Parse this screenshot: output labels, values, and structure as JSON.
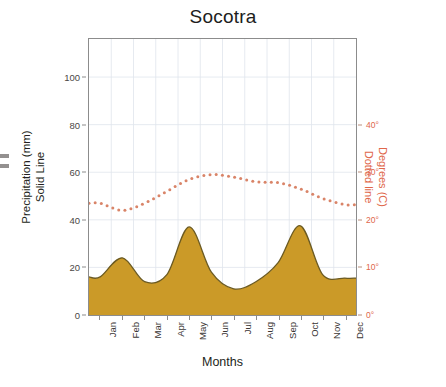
{
  "chart_data": {
    "type": "area",
    "title": "Socotra",
    "xlabel": "Months",
    "categories": [
      "Jan",
      "Feb",
      "Mar",
      "Apr",
      "May",
      "Jun",
      "Jul",
      "Aug",
      "Sep",
      "Oct",
      "Nov",
      "Dec"
    ],
    "grid": true,
    "legend_position": "none",
    "axes": {
      "left": {
        "label_line1": "Precipitation (mm)",
        "label_line2": "Solid Line",
        "ticks": [
          0,
          20,
          40,
          60,
          80,
          100
        ],
        "tick_labels": [
          "0",
          "20",
          "40",
          "60",
          "80",
          "100"
        ],
        "ylim": [
          0,
          116
        ],
        "color": "#4b4745"
      },
      "right": {
        "label_line1": "Degrees (C)",
        "label_line2": "Dotted line",
        "ticks": [
          0,
          10,
          20,
          30,
          40
        ],
        "tick_labels": [
          "0°",
          "10°",
          "20°",
          "30°",
          "40°"
        ],
        "ylim": [
          0,
          58
        ],
        "color": "#e0674a"
      }
    },
    "series": [
      {
        "name": "Precipitation (mm)",
        "style": "filled-area-solid-line",
        "axis": "left",
        "fill_color": "#cb9a28",
        "line_color": "#6b5a22",
        "values": [
          16,
          24,
          14,
          17,
          37,
          18,
          11,
          14,
          22,
          37.5,
          17,
          15.5
        ]
      },
      {
        "name": "Degrees (C)",
        "style": "dotted-line",
        "axis": "right",
        "line_color": "#d98468",
        "values": [
          23.5,
          22.0,
          23.5,
          26.0,
          28.5,
          29.5,
          29.0,
          28.0,
          27.8,
          26.5,
          24.5,
          23.2
        ]
      }
    ]
  },
  "figure": {
    "title": "Socotra",
    "background": "#ffffff",
    "frame_color": "#8c8c8c"
  }
}
